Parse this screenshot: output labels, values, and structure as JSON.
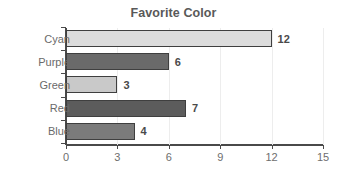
{
  "chart_data": {
    "type": "bar",
    "orientation": "horizontal",
    "title": "Favorite Color",
    "xlabel": "",
    "ylabel": "",
    "categories": [
      "Cyan",
      "Purple",
      "Green",
      "Red",
      "Blue"
    ],
    "values": [
      12,
      6,
      3,
      7,
      4
    ],
    "value_labels": [
      "12",
      "6",
      "3",
      "7",
      "4"
    ],
    "bar_colors": [
      "#dcdcdc",
      "#6a6a6a",
      "#c9c9c9",
      "#5c5c5c",
      "#7b7b7b"
    ],
    "bar_border_color": "#3f3f3f",
    "xlim": [
      0,
      15
    ],
    "xticks": [
      0,
      3,
      6,
      9,
      12,
      15
    ],
    "xtick_labels": [
      "0",
      "3",
      "6",
      "9",
      "12",
      "15"
    ],
    "grid": true,
    "legend": false,
    "title_color": "#595959",
    "axis_color": "#4a4a4a",
    "label_color": "#6a6a6a",
    "background": "#ffffff"
  }
}
